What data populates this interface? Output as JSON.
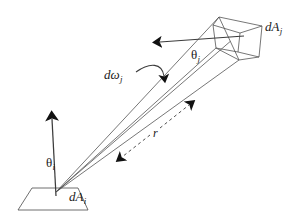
{
  "figure": {
    "kind": "geometry-diagram",
    "topic": "radiative-transfer-form-factor",
    "width": 304,
    "height": 218,
    "background_color": "#ffffff",
    "stroke_color": "#3c3c3c",
    "arrow_fill_color": "#111111",
    "text_color": "#1a1a1a"
  },
  "labels": {
    "theta_i": {
      "symbol": "θ",
      "subscript": "i"
    },
    "theta_j": {
      "symbol": "θ",
      "subscript": "j"
    },
    "domega_j": {
      "symbol": "dω",
      "subscript": "j"
    },
    "dA_i": {
      "symbol": "dA",
      "subscript": "i"
    },
    "dA_j": {
      "symbol": "dA",
      "subscript": "j"
    },
    "r": {
      "symbol": "r",
      "subscript": ""
    }
  },
  "elements": {
    "source_patch": "differential-area-patch-i",
    "receiver_patch": "differential-area-patch-j",
    "normal_vector": "surface-normal-arrow",
    "solid_angle_arrow": "solid-angle-pointer",
    "distance_arrow": "distance-double-arrow",
    "beam": "ray-bundle"
  }
}
